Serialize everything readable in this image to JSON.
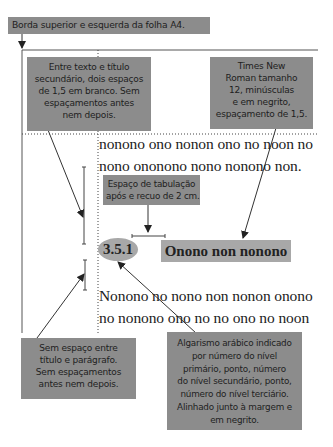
{
  "top_label": "Borda superior e esquerda da folha A4.",
  "note_spacing_before": [
    "Entre texto e título",
    "secundário, dois espaços",
    "de 1,5 em branco. Sem",
    "espaçamentos antes",
    "nem depois."
  ],
  "note_font": [
    "Times New",
    "Roman tamanho",
    "12, minúsculas",
    "e em negrito,",
    "espaçamento de 1,5."
  ],
  "note_tab": [
    "Espaço de tabulação",
    "após e recuo de 2 cm."
  ],
  "note_no_space": [
    "Sem espaço entre",
    "título e parágrafo.",
    "Sem espaçamentos",
    "antes nem depois."
  ],
  "note_numbering": [
    "Algarismo arábico indicado",
    "por número do nível",
    "primário, ponto, número",
    "do nível secundário, ponto,",
    "número do nível terciário.",
    "Alinhado junto à margem e",
    "em negrito."
  ],
  "paragraph1": [
    "nonono ono nonon ono no noon no",
    "nono onononо nono nonono non."
  ],
  "section_number": "3.5.1",
  "section_title": "Onono non nonono",
  "paragraph2": [
    "Nonono no nono non nonon onono",
    "no nonono ono no no ono no noon"
  ],
  "colors": {
    "note_bg": "#8c8c8c",
    "highlight_bg": "#a8a8a8",
    "line": "#333333"
  }
}
